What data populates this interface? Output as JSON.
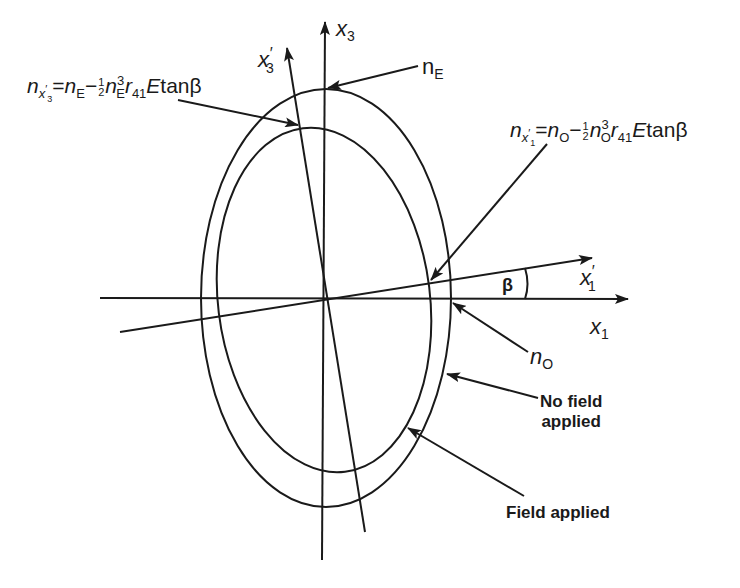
{
  "figure": {
    "axes": {
      "x1": {
        "label": "x",
        "sub": "1"
      },
      "x3": {
        "label": "x",
        "sub": "3"
      },
      "x1_prime": {
        "label": "x",
        "prime": "′",
        "sub": "1"
      },
      "x3_prime": {
        "label": "x",
        "prime": "′",
        "sub": "3"
      },
      "angle": "β"
    },
    "labels": {
      "nE": {
        "n": "n",
        "sub": "E"
      },
      "nO": {
        "n": "n",
        "sub": "O"
      },
      "no_field": [
        "No field",
        "applied"
      ],
      "field": "Field applied"
    },
    "equations": {
      "x3_eq": {
        "lhs": "n",
        "lhs_sub": "x",
        "lhs_subsub": "3",
        "prime": "′",
        "eq": "=",
        "n1": "n",
        "n1_sub": "E",
        "minus": "−",
        "frac_num": "1",
        "frac_den": "2",
        "n2": "n",
        "n2_sub": "E",
        "n2_sup": "3",
        "r": "r",
        "r_sub": "41",
        "tail": "E",
        "tan": "tan",
        "beta": "β"
      },
      "x1_eq": {
        "lhs": "n",
        "lhs_sub": "x",
        "lhs_subsub": "1",
        "prime": "′",
        "eq": "=",
        "n1": "n",
        "n1_sub": "O",
        "minus": "−",
        "frac_num": "1",
        "frac_den": "2",
        "n2": "n",
        "n2_sub": "O",
        "n2_sup": "3",
        "r": "r",
        "r_sub": "41",
        "tail": "E",
        "tan": "tan",
        "beta": "β"
      }
    },
    "colors": {
      "ink": "#1a1a1a",
      "background": "#ffffff"
    }
  }
}
